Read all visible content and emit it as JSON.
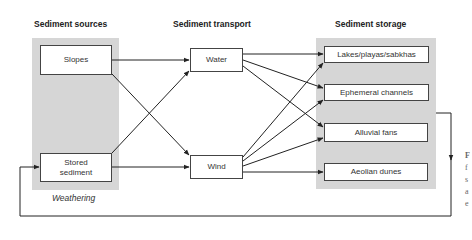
{
  "columns": {
    "sources": {
      "heading": "Sediment sources",
      "footer": "Weathering"
    },
    "transport": {
      "heading": "Sediment transport"
    },
    "storage": {
      "heading": "Sediment storage"
    }
  },
  "nodes": {
    "slopes": "Slopes",
    "stored_sediment": "Stored sediment",
    "water": "Water",
    "wind": "Wind",
    "lakes": "Lakes/playas/sabkhas",
    "ephemeral": "Ephemeral channels",
    "alluvial": "Alluvial fans",
    "aeolian": "Aeolian dunes"
  },
  "edges": [
    {
      "from": "slopes",
      "to": "water"
    },
    {
      "from": "slopes",
      "to": "wind"
    },
    {
      "from": "stored_sediment",
      "to": "water"
    },
    {
      "from": "stored_sediment",
      "to": "wind"
    },
    {
      "from": "water",
      "to": "lakes"
    },
    {
      "from": "water",
      "to": "ephemeral"
    },
    {
      "from": "water",
      "to": "alluvial"
    },
    {
      "from": "wind",
      "to": "lakes"
    },
    {
      "from": "wind",
      "to": "ephemeral"
    },
    {
      "from": "wind",
      "to": "alluvial"
    },
    {
      "from": "wind",
      "to": "aeolian"
    },
    {
      "from": "storage",
      "to": "stored_sediment",
      "type": "feedback-loop"
    }
  ],
  "caption_fragments": [
    "F",
    "f",
    "s",
    "a",
    "e"
  ],
  "colors": {
    "panel": "#d6d6d6",
    "line": "#222222",
    "box_border": "#444444"
  }
}
